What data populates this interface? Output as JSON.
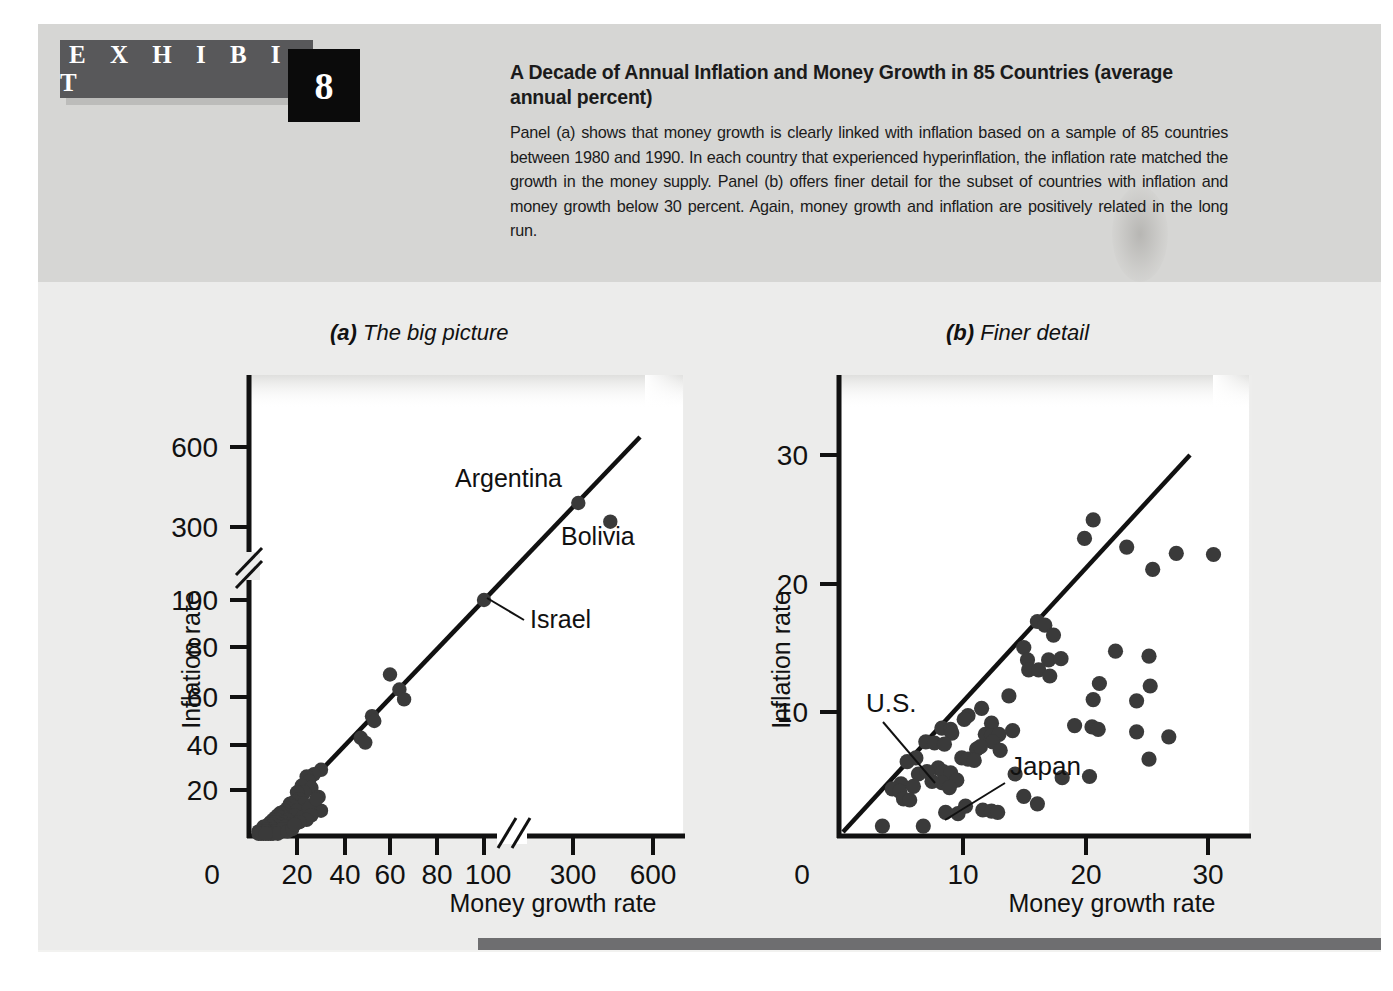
{
  "exhibit": {
    "label": "E X H I B I T",
    "number": "8"
  },
  "caption": {
    "title": "A Decade of Annual Inflation and Money Growth in 85 Countries (average annual percent)",
    "body": "Panel (a) shows that money growth is clearly linked with inflation based on a sample of 85 countries between 1980 and 1990. In each country that experienced hyperinflation, the inflation rate matched the growth in the money supply. Panel (b) offers finer detail for the subset of countries with inflation and money growth below 30 percent. Again, money growth and inflation are positively related in the long run."
  },
  "panels": {
    "a": {
      "tag": "(a)",
      "title": "The big picture"
    },
    "b": {
      "tag": "(b)",
      "title": "Finer detail"
    }
  },
  "colors": {
    "page_background": "#ffffff",
    "header_band": "#d6d6d4",
    "body_band": "#ececeb",
    "exhibit_bar": "#58585a",
    "exhibit_number_box": "#0b0b0b",
    "text": "#1b1b1b",
    "plot_area": "#ffffff",
    "marker": "#3a3a3a",
    "axis": "#111111",
    "rule": "#6e6e70"
  },
  "chart_data": [
    {
      "id": "panel-a",
      "type": "scatter",
      "title": "The big picture",
      "xlabel": "Money growth rate",
      "ylabel": "Inflation rate",
      "xticks": [
        "0",
        "20",
        "40",
        "60",
        "80",
        "100",
        "300",
        "600"
      ],
      "yticks": [
        "20",
        "40",
        "60",
        "80",
        "100",
        "300",
        "600"
      ],
      "axis_break_x": true,
      "axis_break_y": true,
      "grid": false,
      "legend": null,
      "reference_line": {
        "label": "45-degree line",
        "from": [
          3,
          3
        ],
        "to": [
          700,
          700
        ]
      },
      "annotations": [
        {
          "label": "Argentina",
          "x": 320,
          "y": 390
        },
        {
          "label": "Bolivia",
          "x": 440,
          "y": 320
        },
        {
          "label": "Israel",
          "x": 100,
          "y": 100
        }
      ],
      "points": [
        [
          320,
          390
        ],
        [
          440,
          320
        ],
        [
          100,
          100
        ],
        [
          60,
          69
        ],
        [
          64,
          63
        ],
        [
          66,
          59
        ],
        [
          52,
          52
        ],
        [
          53,
          50
        ],
        [
          47,
          43
        ],
        [
          49,
          41
        ],
        [
          30,
          29
        ],
        [
          27,
          27
        ],
        [
          24,
          26
        ],
        [
          25,
          24
        ],
        [
          22,
          22
        ],
        [
          26,
          21
        ],
        [
          23,
          19
        ],
        [
          20,
          19
        ],
        [
          29,
          17
        ],
        [
          21,
          16
        ],
        [
          19,
          15
        ],
        [
          23,
          14
        ],
        [
          17,
          14
        ],
        [
          18,
          13
        ],
        [
          30,
          11
        ],
        [
          16,
          12
        ],
        [
          15,
          11
        ],
        [
          20,
          11
        ],
        [
          14,
          10
        ],
        [
          13,
          10
        ],
        [
          17,
          9
        ],
        [
          12,
          9
        ],
        [
          19,
          9
        ],
        [
          11,
          8
        ],
        [
          15,
          8
        ],
        [
          13,
          8
        ],
        [
          10,
          7
        ],
        [
          16,
          7
        ],
        [
          12,
          7
        ],
        [
          9,
          6
        ],
        [
          14,
          6
        ],
        [
          11,
          6
        ],
        [
          8,
          5
        ],
        [
          13,
          5
        ],
        [
          10,
          5
        ],
        [
          17,
          5
        ],
        [
          7,
          4
        ],
        [
          12,
          4
        ],
        [
          9,
          4
        ],
        [
          15,
          4
        ],
        [
          6,
          4
        ],
        [
          11,
          3
        ],
        [
          8,
          3
        ],
        [
          13,
          3
        ],
        [
          7,
          3
        ],
        [
          10,
          3
        ],
        [
          5,
          2
        ],
        [
          9,
          2
        ],
        [
          12,
          2
        ],
        [
          6,
          2
        ],
        [
          8,
          2
        ],
        [
          4,
          2
        ],
        [
          11,
          2
        ],
        [
          7,
          2
        ],
        [
          14,
          3
        ],
        [
          5,
          1
        ],
        [
          9,
          1
        ],
        [
          6,
          1
        ],
        [
          10,
          1
        ],
        [
          8,
          1
        ],
        [
          12,
          1
        ],
        [
          4,
          1
        ],
        [
          7,
          1
        ],
        [
          16,
          2
        ],
        [
          18,
          3
        ],
        [
          22,
          8
        ],
        [
          25,
          12
        ],
        [
          28,
          16
        ],
        [
          26,
          9
        ],
        [
          24,
          7
        ],
        [
          21,
          6
        ],
        [
          19,
          5
        ]
      ]
    },
    {
      "id": "panel-b",
      "type": "scatter",
      "title": "Finer detail",
      "xlabel": "Money growth rate",
      "ylabel": "Inflation rate",
      "xticks": [
        "0",
        "10",
        "20",
        "30"
      ],
      "yticks": [
        "10",
        "20",
        "30"
      ],
      "xlim": [
        0,
        33
      ],
      "ylim": [
        0,
        33
      ],
      "grid": false,
      "legend": null,
      "reference_line": {
        "label": "45-degree line",
        "from": [
          1.5,
          0.4
        ],
        "to": [
          29.5,
          28.5
        ]
      },
      "annotations": [
        {
          "label": "U.S.",
          "x": 6.2,
          "y": 6.3
        },
        {
          "label": "Japan",
          "x": 8.5,
          "y": 1.9
        }
      ],
      "points": [
        [
          20.5,
          25.5
        ],
        [
          19.8,
          24.0
        ],
        [
          23.2,
          23.3
        ],
        [
          27.2,
          22.8
        ],
        [
          30.2,
          22.7
        ],
        [
          25.3,
          21.5
        ],
        [
          16.0,
          17.3
        ],
        [
          16.6,
          17.0
        ],
        [
          17.3,
          16.2
        ],
        [
          14.9,
          15.2
        ],
        [
          22.3,
          14.9
        ],
        [
          25.0,
          14.5
        ],
        [
          15.2,
          14.2
        ],
        [
          16.9,
          14.2
        ],
        [
          17.9,
          14.3
        ],
        [
          15.3,
          13.4
        ],
        [
          16.1,
          13.4
        ],
        [
          17.0,
          12.9
        ],
        [
          21.0,
          12.3
        ],
        [
          25.1,
          12.1
        ],
        [
          20.5,
          11.0
        ],
        [
          24.0,
          10.9
        ],
        [
          13.7,
          11.3
        ],
        [
          11.5,
          10.3
        ],
        [
          10.4,
          9.7
        ],
        [
          10.1,
          9.4
        ],
        [
          12.3,
          9.1
        ],
        [
          19.0,
          8.9
        ],
        [
          20.4,
          8.8
        ],
        [
          20.9,
          8.6
        ],
        [
          24.0,
          8.4
        ],
        [
          26.6,
          8.0
        ],
        [
          8.3,
          8.7
        ],
        [
          9.0,
          8.6
        ],
        [
          9.1,
          8.3
        ],
        [
          11.8,
          8.2
        ],
        [
          12.3,
          8.1
        ],
        [
          12.9,
          8.2
        ],
        [
          14.0,
          8.5
        ],
        [
          12.4,
          7.6
        ],
        [
          7.0,
          7.6
        ],
        [
          7.7,
          7.5
        ],
        [
          8.5,
          7.4
        ],
        [
          11.1,
          7.0
        ],
        [
          11.4,
          7.2
        ],
        [
          6.2,
          6.3
        ],
        [
          5.5,
          6.0
        ],
        [
          9.9,
          6.3
        ],
        [
          10.4,
          6.2
        ],
        [
          10.9,
          6.1
        ],
        [
          8.0,
          5.5
        ],
        [
          8.4,
          5.2
        ],
        [
          9.0,
          5.1
        ],
        [
          6.4,
          5.0
        ],
        [
          7.1,
          5.2
        ],
        [
          25.0,
          6.2
        ],
        [
          9.5,
          4.5
        ],
        [
          8.3,
          4.3
        ],
        [
          7.5,
          4.4
        ],
        [
          5.0,
          4.2
        ],
        [
          4.3,
          3.8
        ],
        [
          4.9,
          3.6
        ],
        [
          6.0,
          4.0
        ],
        [
          8.9,
          3.9
        ],
        [
          20.2,
          4.8
        ],
        [
          14.9,
          3.2
        ],
        [
          5.2,
          3.0
        ],
        [
          5.7,
          2.9
        ],
        [
          8.6,
          1.9
        ],
        [
          9.6,
          1.8
        ],
        [
          11.6,
          2.1
        ],
        [
          12.3,
          2.0
        ],
        [
          12.8,
          1.9
        ],
        [
          16.0,
          2.6
        ],
        [
          3.5,
          0.8
        ],
        [
          6.8,
          0.8
        ],
        [
          13.0,
          6.9
        ],
        [
          18.0,
          4.7
        ],
        [
          14.2,
          5.0
        ],
        [
          10.2,
          2.4
        ]
      ]
    }
  ]
}
